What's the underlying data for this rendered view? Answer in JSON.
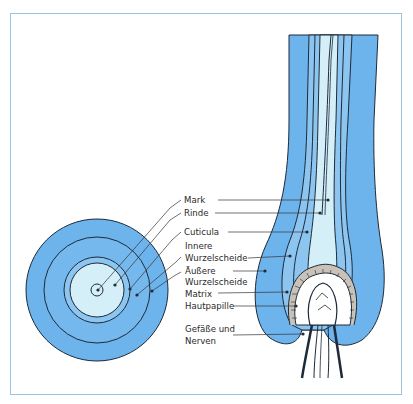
{
  "diagram": {
    "type": "hair-anatomy",
    "colors": {
      "outer_sheath": "#6db3ec",
      "inner_light": "#d4eff8",
      "mid_blue": "#8cc6f0",
      "outline": "#1e2a3a",
      "frame": "#9cc4e0"
    },
    "labels": {
      "mark": "Mark",
      "rinde": "Rinde",
      "cuticula": "Cuticula",
      "innere_1": "Innere",
      "innere_2": "Wurzelscheide",
      "aeussere_1": "Äußere",
      "aeussere_2": "Wurzelscheide",
      "matrix": "Matrix",
      "hautpapille": "Hautpapille",
      "gefaesse_1": "Gefäße und",
      "gefaesse_2": "Nerven"
    }
  }
}
